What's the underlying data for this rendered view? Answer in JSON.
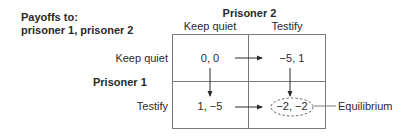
{
  "diagram": {
    "type": "payoff-matrix",
    "payoffs_caption": [
      "Payoffs to:",
      "prisoner 1, prisoner 2"
    ],
    "column_player": "Prisoner 2",
    "row_player": "Prisoner 1",
    "column_strategies": [
      "Keep quiet",
      "Testify"
    ],
    "row_strategies": [
      "Keep quiet",
      "Testify"
    ],
    "cells": [
      [
        "0, 0",
        "−5, 1"
      ],
      [
        "1, −5",
        "−2, −2"
      ]
    ],
    "arrows": [
      {
        "from": [
          0,
          0
        ],
        "to": [
          0,
          1
        ],
        "direction": "right"
      },
      {
        "from": [
          1,
          0
        ],
        "to": [
          1,
          1
        ],
        "direction": "right"
      },
      {
        "from": [
          0,
          0
        ],
        "to": [
          1,
          0
        ],
        "direction": "down"
      },
      {
        "from": [
          0,
          1
        ],
        "to": [
          1,
          1
        ],
        "direction": "down"
      }
    ],
    "equilibrium_cell": [
      1,
      1
    ],
    "equilibrium_label": "Equilibrium"
  },
  "colors": {
    "text": "#2a2a2a",
    "grid": "#7a7a7a",
    "arrow": "#2a2a2a",
    "ellipse": "#555555"
  }
}
